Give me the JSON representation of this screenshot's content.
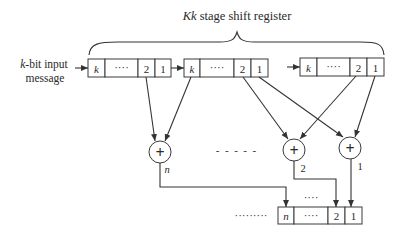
{
  "title": {
    "prefix_italic": "Kk",
    "rest": " stage shift register"
  },
  "input_label": {
    "line1_italic": "k",
    "line1_rest": "-bit input",
    "line2": "message"
  },
  "registers": [
    {
      "cells": [
        "k",
        "····",
        "2",
        "1"
      ]
    },
    {
      "cells": [
        "k",
        "····",
        "2",
        "1"
      ]
    },
    {
      "cells": [
        "k",
        "····",
        "2",
        "1"
      ]
    }
  ],
  "adders": [
    {
      "symbol": "+",
      "label": "n"
    },
    {
      "symbol": "+",
      "label": "2"
    },
    {
      "symbol": "+",
      "label": "1"
    }
  ],
  "adder_gap": "-  -  -  -  -",
  "output_register": {
    "cells": [
      "n",
      "····",
      "2",
      "1"
    ],
    "leading_dots": "·········",
    "above_dots": "····"
  },
  "colors": {
    "line": "#333333",
    "background": "#ffffff"
  }
}
